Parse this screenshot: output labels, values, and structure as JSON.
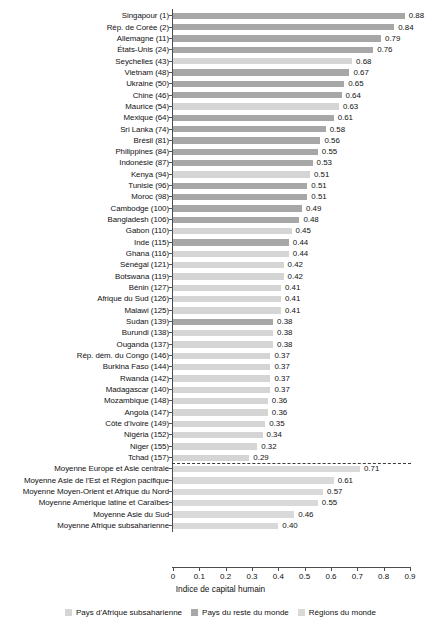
{
  "chart_data": {
    "type": "bar",
    "orientation": "horizontal",
    "title": "",
    "xlabel": "Indice de capital humain",
    "ylabel": "",
    "xlim": [
      0,
      0.9
    ],
    "xticks": [
      "0",
      "0.1",
      "0.2",
      "0.3",
      "0.4",
      "0.5",
      "0.6",
      "0.7",
      "0.8",
      "0.9"
    ],
    "xtick_values": [
      0,
      0.1,
      0.2,
      0.3,
      0.4,
      0.5,
      0.6,
      0.7,
      0.8,
      0.9
    ],
    "grid": false,
    "legend_position": "bottom",
    "categories": [
      "Singapour (1)",
      "Rép. de Corée (2)",
      "Allemagne (11)",
      "États-Unis (24)",
      "Seychelles (43)",
      "Vietnam (48)",
      "Ukraine (50)",
      "Chine (46)",
      "Maurice (54)",
      "Mexique (64)",
      "Sri Lanka (74)",
      "Brésil (81)",
      "Philippines (84)",
      "Indonésie (87)",
      "Kenya (94)",
      "Tunisie (96)",
      "Moroc (98)",
      "Cambodge (100)",
      "Bangladesh (106)",
      "Gabon (110)",
      "Inde (115)",
      "Ghana (116)",
      "Sénégal (121)",
      "Botswana (119)",
      "Bénin (127)",
      "Afrique du Sud (126)",
      "Malawi (125)",
      "Sudan (139)",
      "Burundi (138)",
      "Ouganda (137)",
      "Rép. dém. du Congo (146)",
      "Burkina Faso (144)",
      "Rwanda (142)",
      "Madagascar (140)",
      "Mozambique (148)",
      "Angola (147)",
      "Côte d'Ivoire (149)",
      "Nigéria (152)",
      "Niger (155)",
      "Tchad (157)",
      "Moyenne Europe et Asie centrale",
      "Moyenne Asie de l'Est et Région pacifique",
      "Moyenne Moyen-Orient et Afrique du Nord",
      "Moyenne Amérique latine et Caraïbes",
      "Moyenne Asie du Sud",
      "Moyenne Afrique subsaharienne"
    ],
    "values": [
      0.88,
      0.84,
      0.79,
      0.76,
      0.68,
      0.67,
      0.65,
      0.64,
      0.63,
      0.61,
      0.58,
      0.56,
      0.55,
      0.53,
      0.52,
      0.51,
      0.51,
      0.49,
      0.48,
      0.45,
      0.44,
      0.44,
      0.42,
      0.42,
      0.41,
      0.41,
      0.41,
      0.38,
      0.38,
      0.38,
      0.37,
      0.37,
      0.37,
      0.37,
      0.36,
      0.36,
      0.35,
      0.34,
      0.32,
      0.29,
      0.71,
      0.61,
      0.57,
      0.55,
      0.46,
      0.4
    ],
    "value_labels": [
      "0.88",
      "0.84",
      "0.79",
      "0.76",
      "0.68",
      "0.67",
      "0.65",
      "0.64",
      "0.63",
      "0.61",
      "0.58",
      "0.56",
      "0.55",
      "0.53",
      "0.51",
      "0.51",
      "0.51",
      "0.49",
      "0.48",
      "0.45",
      "0.44",
      "0.44",
      "0.42",
      "0.42",
      "0.41",
      "0.41",
      "0.41",
      "0.38",
      "0.38",
      "0.38",
      "0.37",
      "0.37",
      "0.37",
      "0.37",
      "0.36",
      "0.36",
      "0.35",
      "0.34",
      "0.32",
      "0.29",
      "0.71",
      "0.61",
      "0.57",
      "0.55",
      "0.46",
      "0.40"
    ],
    "series_of": [
      "rest",
      "rest",
      "rest",
      "rest",
      "africa",
      "rest",
      "rest",
      "rest",
      "africa",
      "rest",
      "rest",
      "rest",
      "rest",
      "rest",
      "africa",
      "rest",
      "rest",
      "rest",
      "rest",
      "africa",
      "rest",
      "africa",
      "africa",
      "africa",
      "africa",
      "africa",
      "africa",
      "rest",
      "africa",
      "africa",
      "africa",
      "africa",
      "africa",
      "africa",
      "africa",
      "africa",
      "africa",
      "africa",
      "africa",
      "africa",
      "region",
      "region",
      "region",
      "region",
      "region",
      "region"
    ],
    "series": [
      {
        "name": "Pays d'Afrique subsaharienne",
        "key": "africa",
        "color": "#d5d5d5"
      },
      {
        "name": "Pays du reste du monde",
        "key": "rest",
        "color": "#a7a7a7"
      },
      {
        "name": "Régions du monde",
        "key": "region",
        "color": "#d9d9d9"
      }
    ],
    "separator_after_index": 39,
    "separator_note": "dashed divider between countries and world regions"
  },
  "legend": {
    "items": [
      {
        "label": "Pays d'Afrique subsaharienne",
        "color": "#d5d5d5"
      },
      {
        "label": "Pays du reste du monde",
        "color": "#a7a7a7"
      },
      {
        "label": "Régions du monde",
        "color": "#d9d9d9"
      }
    ]
  },
  "axis": {
    "x_title": "Indice de capital humain"
  }
}
